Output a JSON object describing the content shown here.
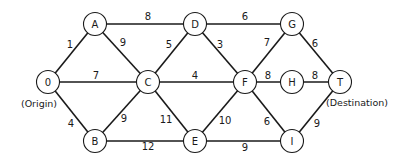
{
  "diagram": {
    "type": "weighted-undirected-network",
    "nodes": [
      {
        "id": "O",
        "label": "0",
        "x": 48,
        "y": 82
      },
      {
        "id": "A",
        "label": "A",
        "x": 95,
        "y": 24
      },
      {
        "id": "B",
        "label": "B",
        "x": 95,
        "y": 141
      },
      {
        "id": "C",
        "label": "C",
        "x": 148,
        "y": 82
      },
      {
        "id": "D",
        "label": "D",
        "x": 195,
        "y": 24
      },
      {
        "id": "E",
        "label": "E",
        "x": 195,
        "y": 141
      },
      {
        "id": "F",
        "label": "F",
        "x": 245,
        "y": 82
      },
      {
        "id": "G",
        "label": "G",
        "x": 292,
        "y": 24
      },
      {
        "id": "H",
        "label": "H",
        "x": 292,
        "y": 82
      },
      {
        "id": "I",
        "label": "I",
        "x": 292,
        "y": 141
      },
      {
        "id": "T",
        "label": "T",
        "x": 340,
        "y": 82
      }
    ],
    "edges": [
      {
        "from": "O",
        "to": "A",
        "weight": "1",
        "lx": 70,
        "ly": 44
      },
      {
        "from": "O",
        "to": "C",
        "weight": "7",
        "lx": 96,
        "ly": 75
      },
      {
        "from": "O",
        "to": "B",
        "weight": "4",
        "lx": 71,
        "ly": 123
      },
      {
        "from": "A",
        "to": "D",
        "weight": "8",
        "lx": 148,
        "ly": 16
      },
      {
        "from": "A",
        "to": "C",
        "weight": "9",
        "lx": 123,
        "ly": 42
      },
      {
        "from": "B",
        "to": "C",
        "weight": "9",
        "lx": 124,
        "ly": 118
      },
      {
        "from": "B",
        "to": "E",
        "weight": "12",
        "lx": 148,
        "ly": 146
      },
      {
        "from": "C",
        "to": "D",
        "weight": "5",
        "lx": 169,
        "ly": 44
      },
      {
        "from": "C",
        "to": "F",
        "weight": "4",
        "lx": 195,
        "ly": 75
      },
      {
        "from": "C",
        "to": "E",
        "weight": "11",
        "lx": 166,
        "ly": 119
      },
      {
        "from": "D",
        "to": "G",
        "weight": "6",
        "lx": 245,
        "ly": 16
      },
      {
        "from": "D",
        "to": "F",
        "weight": "3",
        "lx": 220,
        "ly": 44
      },
      {
        "from": "E",
        "to": "F",
        "weight": "10",
        "lx": 225,
        "ly": 120
      },
      {
        "from": "E",
        "to": "I",
        "weight": "9",
        "lx": 245,
        "ly": 147
      },
      {
        "from": "F",
        "to": "G",
        "weight": "7",
        "lx": 267,
        "ly": 42
      },
      {
        "from": "F",
        "to": "H",
        "weight": "8",
        "lx": 268,
        "ly": 75
      },
      {
        "from": "F",
        "to": "I",
        "weight": "6",
        "lx": 267,
        "ly": 121
      },
      {
        "from": "G",
        "to": "T",
        "weight": "6",
        "lx": 315,
        "ly": 43
      },
      {
        "from": "H",
        "to": "T",
        "weight": "8",
        "lx": 315,
        "ly": 75
      },
      {
        "from": "I",
        "to": "T",
        "weight": "9",
        "lx": 317,
        "ly": 123
      }
    ],
    "annotations": {
      "origin": {
        "text": "(Origin)",
        "x": 39,
        "y": 103
      },
      "destination": {
        "text": "(Destination)",
        "x": 357,
        "y": 102
      }
    }
  }
}
